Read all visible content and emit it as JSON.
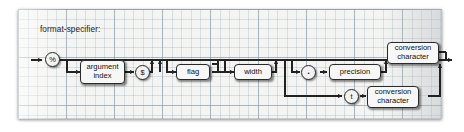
{
  "diagram": {
    "type": "railroad-syntax-diagram",
    "title": "format-specifier:",
    "colors": {
      "paper": "#f4f5f3",
      "grid_minor": "#96a5b4",
      "grid_major": "#788ca0",
      "node_fill": "#f7f7f7",
      "node_stroke": "#2a2a2a",
      "wire": "#222222"
    },
    "nodes": [
      {
        "id": "percent",
        "kind": "terminal",
        "label": "%"
      },
      {
        "id": "argindex",
        "kind": "nonterminal",
        "label": "argument index"
      },
      {
        "id": "dollar",
        "kind": "terminal",
        "label": "$"
      },
      {
        "id": "flag",
        "kind": "nonterminal",
        "label": "flag"
      },
      {
        "id": "width",
        "kind": "nonterminal",
        "label": "width"
      },
      {
        "id": "dot",
        "kind": "terminal",
        "label": "."
      },
      {
        "id": "precision",
        "kind": "nonterminal",
        "label": "precision"
      },
      {
        "id": "convchar1",
        "kind": "nonterminal",
        "label": "conversion character"
      },
      {
        "id": "t",
        "kind": "terminal",
        "label": "t"
      },
      {
        "id": "convchar2",
        "kind": "nonterminal",
        "label": "conversion character"
      }
    ],
    "labels": {
      "percent": "%",
      "argument_index": "argument\nindex",
      "argument_index_line1": "argument",
      "argument_index_line2": "index",
      "dollar": "$",
      "flag": "flag",
      "width": "width",
      "dot": ".",
      "precision": "precision",
      "conversion_character_line1": "conversion",
      "conversion_character_line2": "character",
      "t": "t"
    }
  }
}
